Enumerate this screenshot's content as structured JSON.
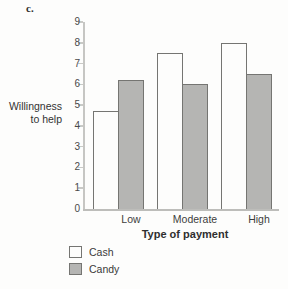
{
  "figure": {
    "panel_label": "c.",
    "background": "#fdfdfc"
  },
  "chart_data": {
    "type": "bar",
    "title": "",
    "xlabel": "Type of payment",
    "ylabel": "Willingness\nto help",
    "categories": [
      "Low",
      "Moderate",
      "High"
    ],
    "series": [
      {
        "name": "Cash",
        "color": "#fdfdfc",
        "values": [
          4.7,
          7.5,
          8.0
        ]
      },
      {
        "name": "Candy",
        "color": "#b5b5b3",
        "values": [
          6.2,
          6.0,
          6.5
        ]
      }
    ],
    "ylim": [
      0,
      9
    ],
    "yticks": [
      0,
      1,
      2,
      3,
      4,
      5,
      6,
      7,
      8,
      9
    ],
    "grid": false,
    "legend_position": "bottom-left",
    "bar_border_color": "#757572",
    "axis_color": "#c6c6c3"
  }
}
